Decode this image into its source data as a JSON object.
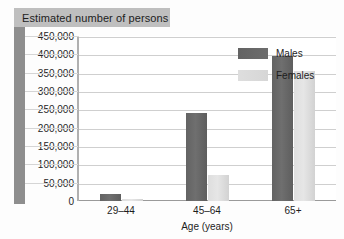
{
  "chart_data": {
    "type": "bar",
    "title": "Estimated number of persons",
    "xlabel": "Age (years)",
    "ylabel": "",
    "categories": [
      "29–44",
      "45–64",
      "65+"
    ],
    "series": [
      {
        "name": "Males",
        "color": "#6b6b6b",
        "values": [
          20000,
          240000,
          395000
        ]
      },
      {
        "name": "Females",
        "color": "#d9d9d9",
        "values": [
          5000,
          72000,
          355000
        ]
      }
    ],
    "ylim": [
      0,
      450000
    ],
    "ytick_step": 50000,
    "yticks": [
      "0",
      "50,000",
      "100,000",
      "150,000",
      "200,000",
      "250,000",
      "300,000",
      "350,000",
      "400,000",
      "450,000"
    ],
    "grid": true,
    "legend_position": "inside-top-right"
  },
  "colors": {
    "title_chip_bg": "#bfbfbf",
    "left_band": "#8e8e8e",
    "gridline": "#cfcfcf",
    "plot_bg": "#ffffff",
    "text": "#1d1d1d"
  }
}
